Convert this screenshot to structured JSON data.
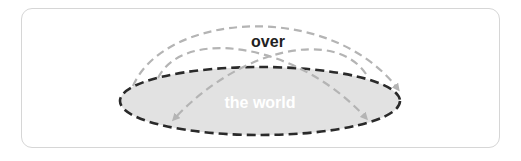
{
  "diagram": {
    "labels": {
      "over": "over",
      "world": "the world"
    },
    "colors": {
      "frame_border": "#d6d6d6",
      "world_fill": "#e2e2e2",
      "world_border": "#2a2a2a",
      "arrow": "#b4b4b4",
      "over_text": "#222222",
      "world_text": "#ffffff"
    },
    "shapes": {
      "world_ellipse": {
        "cx": 260,
        "cy": 101,
        "rx": 140,
        "ry": 34
      },
      "arrows": [
        {
          "name": "outer-arc",
          "from": [
            133,
            86
          ],
          "to": [
            400,
            90
          ]
        },
        {
          "name": "left-to-right-inner-arc",
          "from": [
            158,
            78
          ],
          "to": [
            368,
            120
          ]
        },
        {
          "name": "right-to-left-inner-arc",
          "from": [
            365,
            72
          ],
          "to": [
            172,
            121
          ]
        }
      ]
    }
  }
}
